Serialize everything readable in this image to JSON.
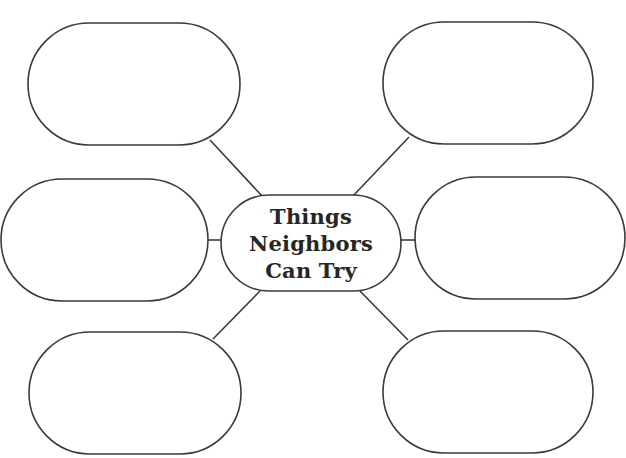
{
  "diagram": {
    "type": "web-organizer",
    "center": {
      "lines": [
        "Things",
        "Neighbors",
        "Can Try"
      ]
    },
    "branches": [
      {
        "position": "top-left",
        "text": ""
      },
      {
        "position": "top-right",
        "text": ""
      },
      {
        "position": "middle-left",
        "text": ""
      },
      {
        "position": "middle-right",
        "text": ""
      },
      {
        "position": "bottom-left",
        "text": ""
      },
      {
        "position": "bottom-right",
        "text": ""
      }
    ],
    "colors": {
      "stroke": "#3a3a3a",
      "text": "#262626",
      "background": "#ffffff"
    }
  }
}
